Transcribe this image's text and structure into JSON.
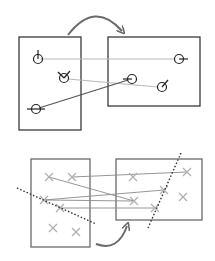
{
  "diagram": {
    "colors": {
      "box_stroke": "#3a3a3a",
      "box_stroke_light": "#6a6a6a",
      "match_line_light": "#b8b8b8",
      "match_line_dark": "#555555",
      "keypoint": "#222222",
      "cross": "#b0b0b0",
      "dotted_line": "#333333",
      "arrow": "#6a6a6a"
    },
    "top_panel": {
      "left_box": {
        "x": 19,
        "y": 37,
        "w": 62,
        "h": 93
      },
      "right_box": {
        "x": 108,
        "y": 37,
        "w": 92,
        "h": 69
      },
      "arrow": {
        "from": [
          68,
          35
        ],
        "ctrl": [
          95,
          0
        ],
        "to": [
          122,
          31
        ]
      },
      "left_keypoints": [
        {
          "x": 38,
          "y": 59,
          "tick": [
            38,
            50
          ]
        },
        {
          "x": 64,
          "y": 78,
          "tick": [
            70,
            71
          ],
          "tick2": [
            58,
            72
          ]
        },
        {
          "x": 36,
          "y": 109,
          "tick": [
            27,
            109
          ],
          "tick2": [
            45,
            109
          ]
        }
      ],
      "right_keypoints": [
        {
          "x": 179,
          "y": 59,
          "tick": [
            188,
            59
          ]
        },
        {
          "x": 132,
          "y": 79,
          "tick": [
            123,
            79
          ]
        },
        {
          "x": 162,
          "y": 87,
          "tick": [
            168,
            80
          ]
        }
      ],
      "matches": [
        {
          "from": [
            41,
            59
          ],
          "to": [
            175,
            59
          ],
          "style": "light"
        },
        {
          "from": [
            68,
            79
          ],
          "to": [
            158,
            87
          ],
          "style": "light"
        },
        {
          "from": [
            39,
            108
          ],
          "to": [
            128,
            80
          ],
          "style": "dark"
        }
      ]
    },
    "bottom_panel": {
      "left_box": {
        "x": 31,
        "y": 159,
        "w": 59,
        "h": 88
      },
      "right_box": {
        "x": 116,
        "y": 159,
        "w": 86,
        "h": 61
      },
      "left_crosses": [
        [
          49,
          177
        ],
        [
          72,
          177
        ],
        [
          44,
          200
        ],
        [
          60,
          208
        ],
        [
          53,
          228
        ],
        [
          76,
          232
        ]
      ],
      "right_crosses": [
        [
          133,
          177
        ],
        [
          187,
          172
        ],
        [
          134,
          201
        ],
        [
          164,
          190
        ],
        [
          155,
          208
        ],
        [
          183,
          197
        ]
      ],
      "matches": [
        [
          [
            72,
            177
          ],
          [
            187,
            172
          ]
        ],
        [
          [
            49,
            177
          ],
          [
            134,
            201
          ]
        ],
        [
          [
            44,
            200
          ],
          [
            164,
            190
          ]
        ],
        [
          [
            60,
            208
          ],
          [
            155,
            208
          ]
        ],
        [
          [
            44,
            200
          ],
          [
            134,
            201
          ]
        ]
      ],
      "dotted_lines": [
        {
          "from": [
            17,
            188
          ],
          "to": [
            96,
            224
          ]
        },
        {
          "from": [
            181,
            153
          ],
          "to": [
            148,
            228
          ]
        }
      ],
      "arrow": {
        "from": [
          96,
          244
        ],
        "ctrl": [
          118,
          252
        ],
        "to": [
          127,
          226
        ]
      }
    }
  }
}
